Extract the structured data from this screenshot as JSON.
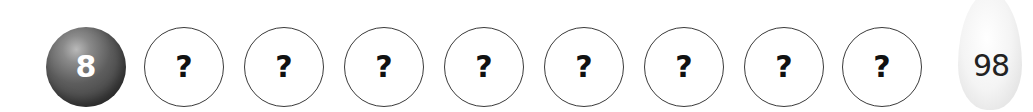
{
  "ball": {
    "label": "8",
    "color": "#555555"
  },
  "slots": [
    {
      "label": "?"
    },
    {
      "label": "?"
    },
    {
      "label": "?"
    },
    {
      "label": "?"
    },
    {
      "label": "?"
    },
    {
      "label": "?"
    },
    {
      "label": "?"
    },
    {
      "label": "?"
    }
  ],
  "pin": {
    "label": "98"
  }
}
